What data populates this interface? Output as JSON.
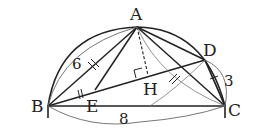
{
  "diagram": {
    "type": "geometry",
    "points": {
      "A": {
        "label": "A",
        "x": 137,
        "y": 27
      },
      "B": {
        "label": "B",
        "x": 48,
        "y": 106
      },
      "C": {
        "label": "C",
        "x": 225,
        "y": 106
      },
      "D": {
        "label": "D",
        "x": 205,
        "y": 60
      },
      "E": {
        "label": "E",
        "x": 95,
        "y": 90
      },
      "H": {
        "label": "H",
        "x": 148,
        "y": 75
      }
    },
    "measurements": {
      "AB": "6",
      "BC": "8",
      "DC": "3"
    },
    "colors": {
      "stroke": "#222222",
      "thin": "#555555",
      "background": "#ffffff"
    }
  }
}
